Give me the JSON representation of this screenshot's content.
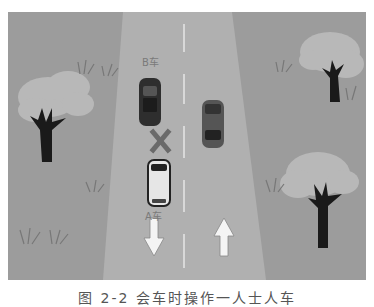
{
  "scene": {
    "colors": {
      "grass": "#9c9c9c",
      "road": "#b0b0b0",
      "center_line": "#d8d8d8",
      "bush": "#b8b8b8",
      "tree_trunk": "#1a1a1a",
      "arrow": "#f4f4f4",
      "car_dark": "#2e2e2e",
      "car_light": "#e6e6e6",
      "x_mark": "#6a6a6a"
    },
    "labels": {
      "car_b": "B车",
      "car_a": "A车"
    },
    "arrows": [
      {
        "direction": "down"
      },
      {
        "direction": "up"
      }
    ]
  },
  "caption": "图 2-2  会车时操作一人士人车"
}
